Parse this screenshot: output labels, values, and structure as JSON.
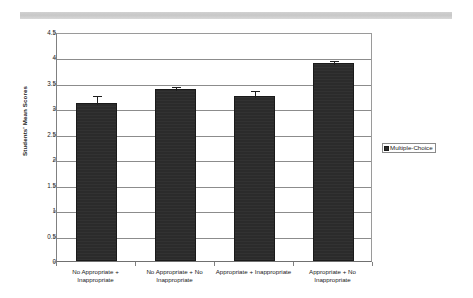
{
  "chart_data": {
    "type": "bar",
    "title": "",
    "subtitle": "",
    "xlabel": "",
    "ylabel": "Students' Mean Scores",
    "ylim": [
      0,
      4.5
    ],
    "ytick_labels": [
      "0",
      "0.5",
      "1",
      "1.5",
      "2",
      "2.5",
      "3",
      "3.5",
      "4",
      "4.5"
    ],
    "ytick_values": [
      0,
      0.5,
      1,
      1.5,
      2,
      2.5,
      3,
      3.5,
      4,
      4.5
    ],
    "grid": true,
    "legend_position": "right",
    "categories": [
      "No Appropriate + Inappropriate",
      "No Appropriate + No Inappropriate",
      "Appropriate + Inappropriate",
      "Appropriate + No Inappropriate"
    ],
    "series": [
      {
        "name": "Multiple-Choice",
        "color": "#2b2b2b",
        "values": [
          3.11,
          3.38,
          3.25,
          3.89
        ],
        "errors_upper": [
          3.28,
          3.45,
          3.38,
          3.97
        ],
        "errors_lower": [
          2.94,
          3.31,
          3.12,
          3.81
        ]
      }
    ],
    "legend": [
      "Multiple-Choice"
    ]
  },
  "legend": {
    "entries": [
      {
        "label": "Multiple-Choice",
        "swatch_name": "legend-swatch-multiple-choice"
      }
    ]
  },
  "axes": {
    "y_title": "Students' Mean Scores"
  },
  "colors": {
    "bar_fill": "#2b2b2b",
    "grid": "#8c8c8c",
    "axis": "#707070",
    "text": "#1a1a1a",
    "scan_band": "#c9c9c9"
  }
}
